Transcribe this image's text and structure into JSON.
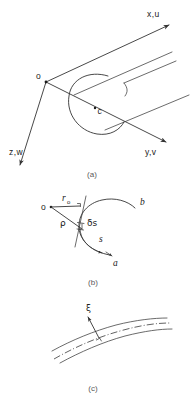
{
  "figure": {
    "background_color": "#ffffff",
    "line_color": "#333333",
    "text_color": "#1a1a1a",
    "caption_color": "#5a5a5a"
  },
  "panels": [
    {
      "id": "a",
      "caption": "(a)",
      "description": "Cartesian axes x,u / y,v / z,w with origin o and a cylindrical body of centre c",
      "labels": {
        "axis_x": "x,u",
        "axis_y": "y,v",
        "axis_z": "z,w",
        "origin": "o",
        "centre": "c"
      }
    },
    {
      "id": "b",
      "caption": "(b)",
      "description": "Curve from a to b with radius r0, radius of curvature rho from pole o, arc length s and element delta-s",
      "labels": {
        "radius_zero": "r",
        "radius_zero_sub": "o",
        "rho": "ρ",
        "delta_s": "δs",
        "arc_s": "s",
        "origin": "o",
        "end_a": "a",
        "end_b": "b"
      }
    },
    {
      "id": "c",
      "caption": "(c)",
      "description": "Curved channel walls with dash-dot centreline and normal coordinate xi",
      "labels": {
        "xi": "ξ"
      }
    }
  ]
}
